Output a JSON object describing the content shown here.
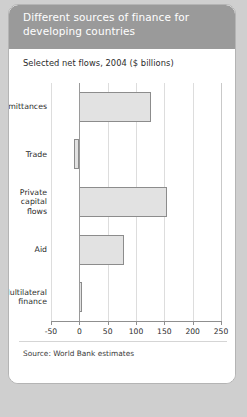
{
  "card": {
    "title": "Different sources of finance for developing countries",
    "subtitle": "Selected net flows, 2004 ($ billions)",
    "source": "Source: World Bank estimates"
  },
  "colors": {
    "header_bg": "#9a9a9a",
    "card_bg": "#ffffff",
    "page_bg": "#cfcfcf",
    "bar_fill": "#e2e2e2",
    "bar_stroke": "#8c8c8c",
    "gridline": "#dddddd",
    "axis": "#8f8f8f"
  },
  "chart_data": {
    "type": "bar",
    "orientation": "horizontal",
    "title": "Different sources of finance for developing countries",
    "subtitle": "Selected net flows, 2004 ($ billions)",
    "xlabel": "",
    "ylabel": "",
    "xlim": [
      -50,
      250
    ],
    "xticks": [
      -50,
      0,
      50,
      100,
      150,
      200,
      250
    ],
    "xtick_labels": [
      "-50",
      "0",
      "50",
      "100",
      "150",
      "200",
      "250"
    ],
    "grid": true,
    "legend": false,
    "units": "$ billions",
    "categories": [
      "Remittances",
      "Trade",
      "Private capital flows",
      "Aid",
      "Multilateral finance"
    ],
    "values": [
      126,
      -10,
      155,
      79,
      4
    ],
    "bars": [
      {
        "label": "Remittances",
        "label_lines": "Remittances",
        "value": 126
      },
      {
        "label": "Trade",
        "label_lines": "Trade",
        "value": -10
      },
      {
        "label": "Private capital flows",
        "label_lines": "Private\ncapital\nflows",
        "value": 155
      },
      {
        "label": "Aid",
        "label_lines": "Aid",
        "value": 79
      },
      {
        "label": "Multilateral finance",
        "label_lines": "Multilateral\nfinance",
        "value": 4
      }
    ],
    "source": "Source: World Bank estimates"
  }
}
